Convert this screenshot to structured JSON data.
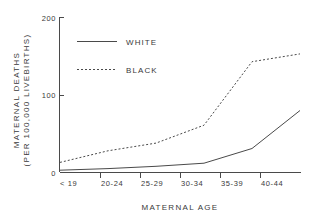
{
  "chart_data": {
    "type": "line",
    "title": "",
    "xlabel": "MATERNAL AGE",
    "ylabel": "MATERNAL DEATHS (PER 100,000 LIVEBIRTHS)",
    "ylabel_line1": "MATERNAL  DEATHS",
    "ylabel_line2": "(PER 100,000 LIVEBIRTHS)",
    "categories": [
      "< 19",
      "20-24",
      "25-29",
      "30-34",
      "35-39",
      "40-44"
    ],
    "ylim": [
      0,
      200
    ],
    "yticks": [
      0,
      100,
      200
    ],
    "ytick_labels": [
      "0",
      "100",
      "200"
    ],
    "grid": false,
    "legend_position": "upper-left-inside",
    "series": [
      {
        "name": "WHITE",
        "style": "solid",
        "values": [
          3,
          5,
          8,
          12,
          31,
          80
        ]
      },
      {
        "name": "BLACK",
        "style": "dotted",
        "values": [
          13,
          28,
          38,
          61,
          143,
          153
        ]
      }
    ]
  },
  "axes": {
    "y_top_label": "200",
    "y_mid_label": "100",
    "y_bottom_label": "0"
  },
  "legend": {
    "entries": [
      {
        "label": "WHITE",
        "style": "solid"
      },
      {
        "label": "BLACK",
        "style": "dotted"
      }
    ]
  }
}
